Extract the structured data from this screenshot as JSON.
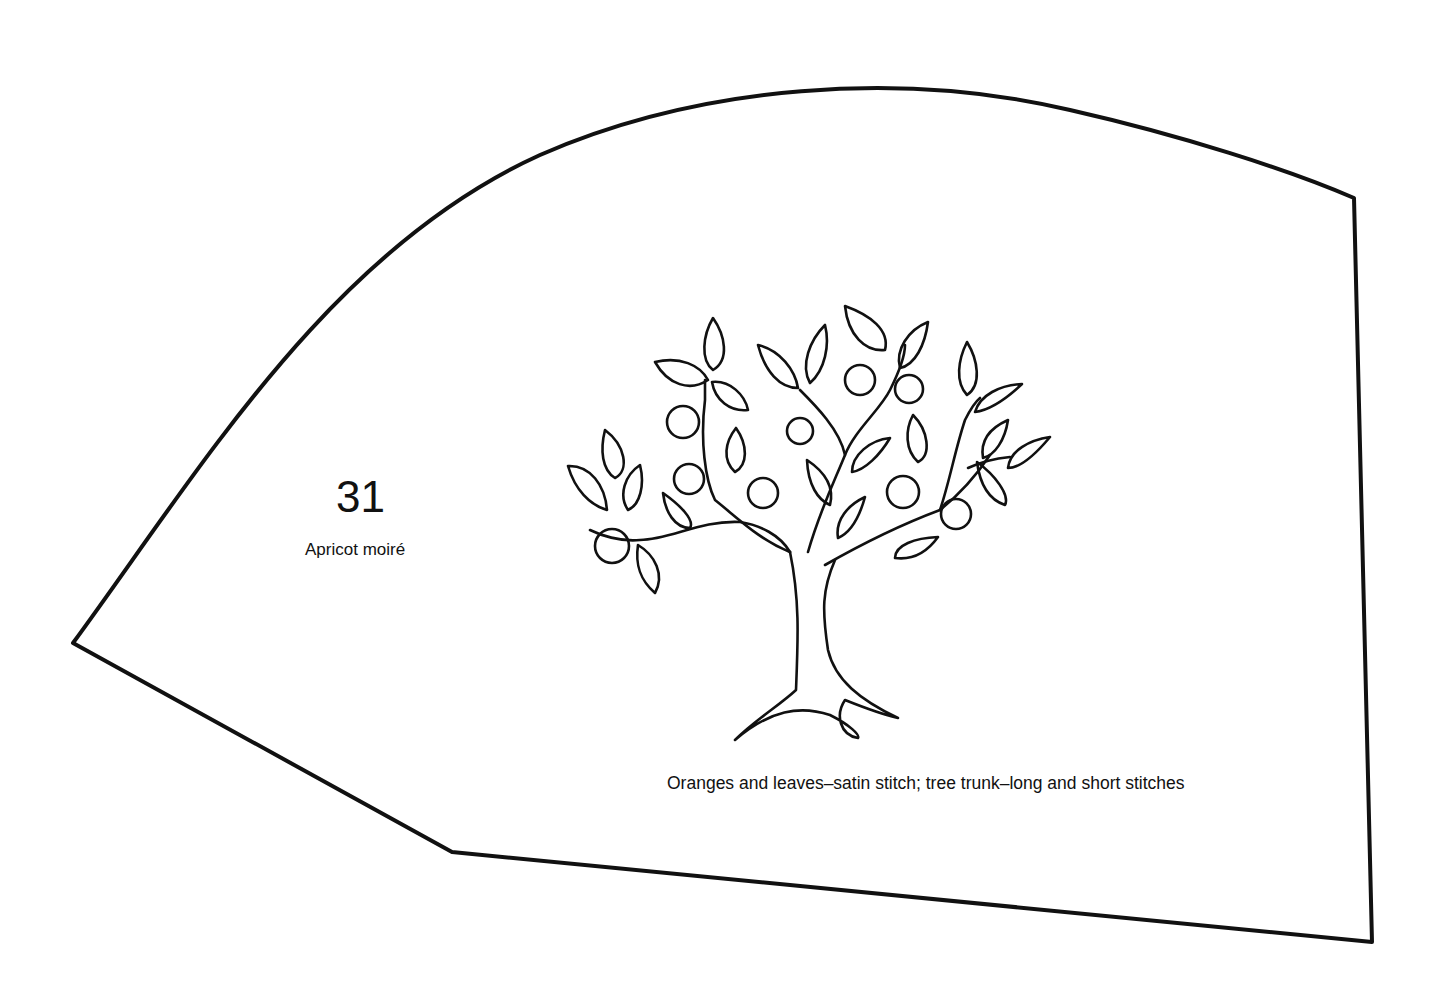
{
  "pattern": {
    "number": "31",
    "fabric": "Apricot moiré",
    "instructions": "Oranges and leaves–satin stitch; tree trunk–long and short stitches",
    "motif": "orange-tree",
    "line_color": "#111111",
    "background": "#ffffff"
  }
}
